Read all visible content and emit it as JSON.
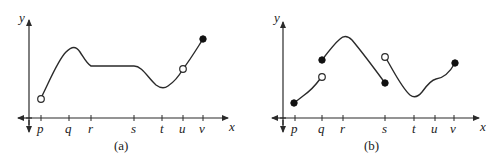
{
  "figures": [
    {
      "id": "a",
      "caption": "(a)",
      "axis_labels": {
        "x": "x",
        "y": "y"
      },
      "ticks": [
        "p",
        "q",
        "r",
        "s",
        "t",
        "u",
        "v"
      ],
      "points": [
        {
          "at": "p",
          "type": "open"
        },
        {
          "at": "u",
          "type": "open"
        },
        {
          "at": "v",
          "type": "closed"
        }
      ]
    },
    {
      "id": "b",
      "caption": "(b)",
      "axis_labels": {
        "x": "x",
        "y": "y"
      },
      "ticks": [
        "p",
        "q",
        "r",
        "s",
        "t",
        "u",
        "v"
      ],
      "points": [
        {
          "at": "p",
          "type": "closed"
        },
        {
          "at": "q",
          "type": "open",
          "position": "lower"
        },
        {
          "at": "q",
          "type": "closed",
          "position": "upper"
        },
        {
          "at": "s",
          "type": "closed",
          "position": "lower"
        },
        {
          "at": "s",
          "type": "open",
          "position": "upper"
        },
        {
          "at": "v",
          "type": "closed"
        }
      ]
    }
  ]
}
